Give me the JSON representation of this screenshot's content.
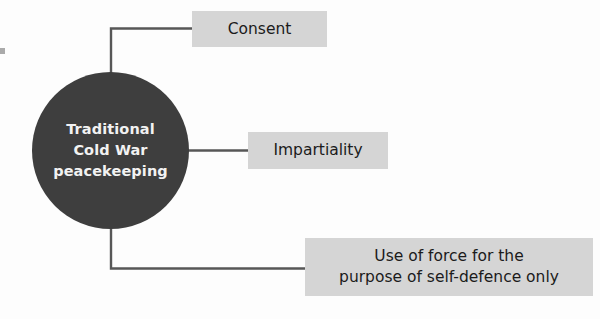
{
  "diagram": {
    "type": "hub-and-spoke",
    "hub": {
      "name": "traditional-cold-war-peacekeeping",
      "line1": "Traditional",
      "line2": "Cold War",
      "line3": "peacekeeping",
      "fill_color": "#3e3e3e",
      "text_color": "#f2f2f2"
    },
    "nodes": [
      {
        "id": "consent",
        "label": "Consent",
        "fill_color": "#d5d5d5",
        "text_color": "#1b1b1b",
        "connector": "elbow-up-right"
      },
      {
        "id": "impartiality",
        "label": "Impartiality",
        "fill_color": "#d5d5d5",
        "text_color": "#1b1b1b",
        "connector": "straight-right"
      },
      {
        "id": "use-of-force",
        "label": "Use of force for the\npurpose of self-defence only",
        "fill_color": "#d5d5d5",
        "text_color": "#1b1b1b",
        "connector": "elbow-down-right"
      }
    ],
    "connector_color": "#575757",
    "background_color": "#fdfdfd"
  }
}
